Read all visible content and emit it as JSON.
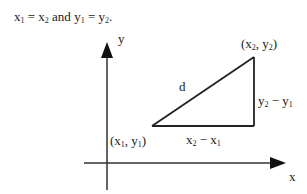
{
  "header": {
    "x1": "x",
    "x1_sub": "1",
    "eq1": " = ",
    "x2": "x",
    "x2_sub": "2",
    "and": " and ",
    "y1": "y",
    "y1_sub": "1",
    "eq2": " = ",
    "y2": "y",
    "y2_sub": "2",
    "end": "."
  },
  "axes": {
    "y_label": "y",
    "x_label": "x"
  },
  "points": {
    "p1": {
      "open": "(x",
      "sub1": "1",
      "mid": ", y",
      "sub2": "1",
      "close": ")"
    },
    "p2": {
      "open": "(x",
      "sub1": "2",
      "mid": ", y",
      "sub2": "2",
      "close": ")"
    }
  },
  "sides": {
    "hyp": "d",
    "horizontal": {
      "a": "x",
      "a_sub": "2",
      "op": " − ",
      "b": "x",
      "b_sub": "1"
    },
    "vertical": {
      "a": "y",
      "a_sub": "2",
      "op": " − ",
      "b": "y",
      "b_sub": "1"
    }
  },
  "colors": {
    "line": "#222222",
    "background": "#ffffff"
  }
}
